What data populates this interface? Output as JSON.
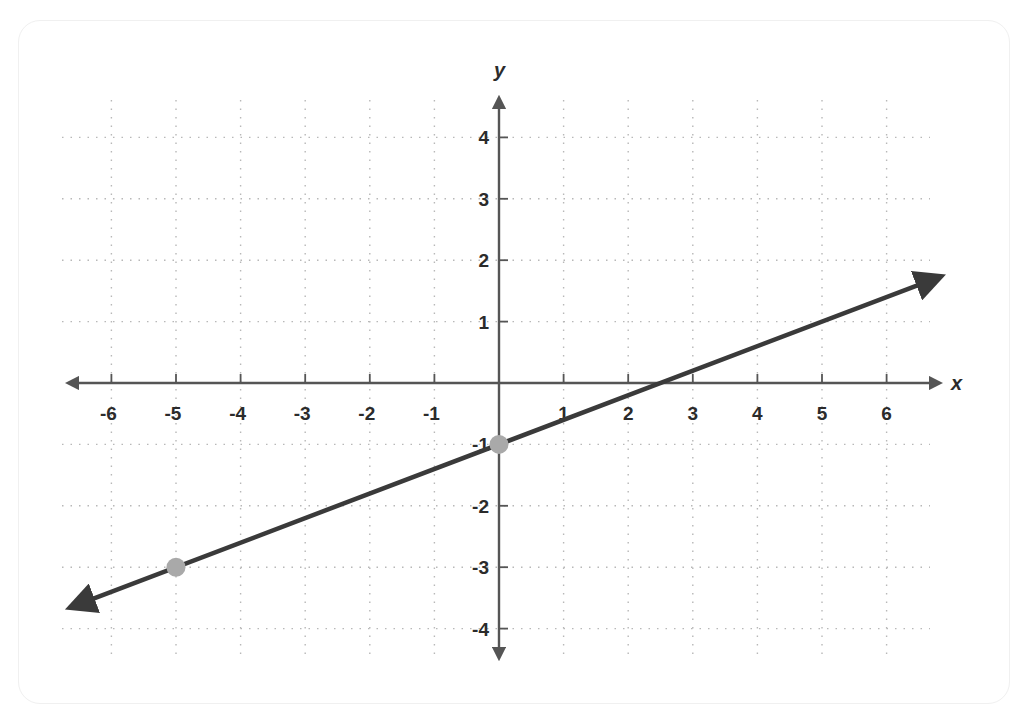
{
  "chart_data": {
    "type": "line",
    "title": "",
    "xlabel": "x",
    "ylabel": "y",
    "xlim": [
      -6.5,
      6.5
    ],
    "ylim": [
      -4.5,
      4.5
    ],
    "x_ticks": [
      -6,
      -5,
      -4,
      -3,
      -2,
      -1,
      1,
      2,
      3,
      4,
      5,
      6
    ],
    "y_ticks": [
      4,
      3,
      2,
      1,
      -1,
      -2,
      -3,
      -4
    ],
    "grid": true,
    "grid_style": "dotted",
    "series": [
      {
        "name": "line",
        "equation": "y = 0.4x - 1",
        "slope": 0.4,
        "intercept": -1,
        "x": [
          -6.4,
          6.6
        ],
        "y": [
          -3.56,
          1.64
        ],
        "arrows_both_ends": true,
        "color": "#3a3a3a"
      }
    ],
    "points": [
      {
        "x": -5,
        "y": -3,
        "color": "#a9a9a9"
      },
      {
        "x": 0,
        "y": -1,
        "color": "#a9a9a9"
      }
    ],
    "legend": null
  },
  "axes": {
    "x_title": "x",
    "y_title": "y",
    "x_labels": [
      "-6",
      "-5",
      "-4",
      "-3",
      "-2",
      "-1",
      "1",
      "2",
      "3",
      "4",
      "5",
      "6"
    ],
    "y_labels": [
      "4",
      "3",
      "2",
      "1",
      "-1",
      "-2",
      "-3",
      "-4"
    ]
  },
  "colors": {
    "axis": "#555555",
    "grid": "#b8b8b8",
    "line": "#3a3a3a",
    "point": "#a9a9a9",
    "text": "#2b2b2b"
  }
}
